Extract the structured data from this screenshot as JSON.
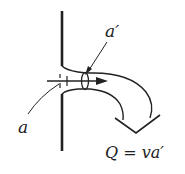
{
  "diagram": {
    "labels": {
      "orifice_area": "a",
      "contracted_area": "a′",
      "flow_equation": "Q = va′"
    },
    "colors": {
      "stroke": "#222222",
      "background": "#ffffff"
    }
  }
}
